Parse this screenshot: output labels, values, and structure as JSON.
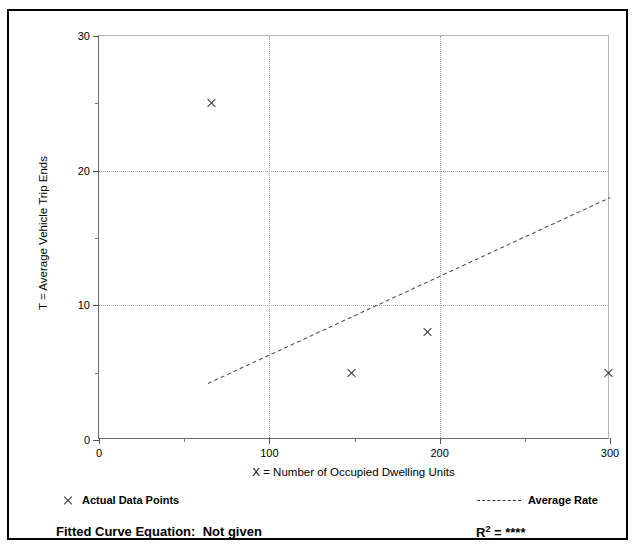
{
  "page": {
    "bleed_text_left": "",
    "bleed_text_right": ""
  },
  "chart_data": {
    "type": "scatter",
    "title": "",
    "xlabel": "X = Number of Occupied Dwelling Units",
    "ylabel": "T = Average Vehicle Trip Ends",
    "xlim": [
      0,
      300
    ],
    "ylim": [
      0,
      30
    ],
    "x_ticks_major": [
      0,
      100,
      200,
      300
    ],
    "x_ticks_minor": [
      50,
      150,
      250
    ],
    "y_ticks_major": [
      0,
      10,
      20,
      30
    ],
    "y_ticks_minor": [
      5,
      15,
      25
    ],
    "grid": "dotted gridlines at major ticks",
    "legend_position": "below plot",
    "series": [
      {
        "name": "Actual Data Points",
        "type": "scatter",
        "marker": "x",
        "points": [
          {
            "x": 66,
            "y": 25
          },
          {
            "x": 148,
            "y": 5
          },
          {
            "x": 193,
            "y": 8
          },
          {
            "x": 299,
            "y": 5
          }
        ]
      },
      {
        "name": "Average Rate",
        "type": "line",
        "style": "dashed",
        "points": [
          {
            "x": 64,
            "y": 4.2
          },
          {
            "x": 300,
            "y": 18.0
          }
        ]
      }
    ],
    "annotations": {
      "fitted_curve_label": "Fitted Curve Equation:",
      "fitted_curve_value": "Not given",
      "r2_label": "R",
      "r2_exponent": "2",
      "r2_equals": " = ",
      "r2_value": "****"
    }
  },
  "legend": {
    "actual_points_label": "Actual Data Points",
    "average_rate_label": "Average Rate",
    "marker_icon": "x-marker-icon",
    "line_icon": "dashed-line-icon"
  },
  "axis_tick_labels": {
    "y": [
      "0",
      "10",
      "20",
      "30"
    ],
    "x": [
      "0",
      "100",
      "200",
      "300"
    ]
  },
  "colors": {
    "frame": "#000000",
    "axis": "#6b6b6b",
    "grid": "#a9a9a9",
    "marker": "#3a3a3a",
    "trendline": "#555555",
    "background": "#ffffff"
  }
}
